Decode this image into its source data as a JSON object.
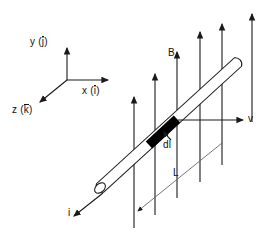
{
  "diagram": {
    "stroke_color": "#1a1a1a",
    "rod_fill": "#ffffff",
    "segment_fill": "#000000",
    "background": "#ffffff"
  },
  "axes": {
    "origin": {
      "x": 67,
      "y": 80
    },
    "items": [
      {
        "id": "y-axis",
        "label_base": "y",
        "label_vector": "j",
        "overline": true,
        "tip": {
          "x": 67,
          "y": 46
        }
      },
      {
        "id": "x-axis",
        "label_base": "x",
        "label_vector": "i",
        "overline": true,
        "tip": {
          "x": 110,
          "y": 80
        }
      },
      {
        "id": "z-axis",
        "label_base": "z",
        "label_vector": "k",
        "overline": false,
        "tip": {
          "x": 38,
          "y": 104
        }
      }
    ]
  },
  "labels": {
    "y_axis": "y (",
    "y_axis_vec": "j",
    "y_axis_close": ")",
    "x_axis": "x (",
    "x_axis_vec": "i",
    "x_axis_close": ")",
    "z_axis": "z (",
    "z_axis_vec": "k",
    "z_axis_close": ")",
    "magnetic_field": "B",
    "velocity": "v",
    "element_length": "dl",
    "rod_length": "L",
    "current": "i"
  },
  "field": {
    "name": "magnetic-field-arrows",
    "direction": "up",
    "label": "B",
    "arrows": [
      {
        "x": 134,
        "y_tip": 95,
        "y_base": 228
      },
      {
        "x": 155,
        "y_tip": 72,
        "y_base": 215
      },
      {
        "x": 177,
        "y_tip": 50,
        "y_base": 198
      },
      {
        "x": 200,
        "y_tip": 30,
        "y_base": 182
      },
      {
        "x": 222,
        "y_tip": 22,
        "y_base": 165
      },
      {
        "x": 252,
        "y_tip": 12,
        "y_base": 122
      }
    ]
  },
  "rod": {
    "name": "conducting-rod",
    "start": {
      "x": 100,
      "y": 188
    },
    "end": {
      "x": 238,
      "y": 62
    },
    "half_width": 5,
    "current_label": "i",
    "current_arrow": {
      "from": {
        "x": 72,
        "y": 218
      },
      "to": {
        "x": 103,
        "y": 193
      }
    }
  },
  "segment": {
    "name": "current-element-dl",
    "label": "dl",
    "start": {
      "x": 150,
      "y": 144
    },
    "end": {
      "x": 176,
      "y": 120
    },
    "pointer": {
      "from": {
        "x": 170,
        "y": 139
      },
      "to": {
        "x": 163,
        "y": 131
      }
    }
  },
  "velocity": {
    "name": "velocity-arrow",
    "label": "v",
    "from": {
      "x": 178,
      "y": 120
    },
    "to": {
      "x": 245,
      "y": 120
    }
  },
  "length_dim": {
    "name": "rod-length-L",
    "label": "L",
    "from": {
      "x": 222,
      "y": 143
    },
    "to": {
      "x": 136,
      "y": 213
    }
  }
}
